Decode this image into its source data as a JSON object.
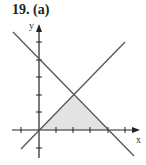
{
  "title": "19.  (a)",
  "axes": {
    "x_label": "x",
    "y_label": "y"
  },
  "lines": [
    {
      "equation": "y = x"
    },
    {
      "equation": "y = 4 - x"
    }
  ],
  "shaded_region": {
    "vertices": [
      [
        0,
        0
      ],
      [
        2,
        2
      ],
      [
        4,
        0
      ]
    ],
    "color": "#e3e3e3"
  },
  "colors": {
    "line": "#555555",
    "axis": "#222222"
  }
}
